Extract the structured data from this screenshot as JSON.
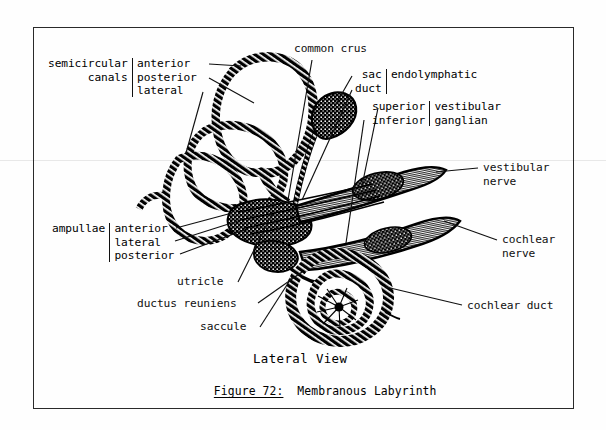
{
  "figure": {
    "view_label": "Lateral View",
    "figure_number": "Figure 72:",
    "figure_title": "Membranous Labyrinth",
    "frame_color": "#2a2a2a",
    "ink_color": "#000000",
    "background_color": "#fefefe"
  },
  "labels": {
    "semicircular_canals": {
      "group_label_line1": "semicircular",
      "group_label_line2": "canals",
      "items": [
        "anterior",
        "posterior",
        "lateral"
      ]
    },
    "common_crus": "common crus",
    "endolymphatic": {
      "items": [
        "sac",
        "duct"
      ],
      "group_label": "endolymphatic"
    },
    "vestibular_ganglian": {
      "items": [
        "superior",
        "inferior"
      ],
      "group_label_line1": "vestibular",
      "group_label_line2": "ganglian"
    },
    "vestibular_nerve_line1": "vestibular",
    "vestibular_nerve_line2": "nerve",
    "cochlear_nerve_line1": "cochlear",
    "cochlear_nerve_line2": "nerve",
    "cochlear_duct": "cochlear duct",
    "ampullae": {
      "group_label": "ampullae",
      "items": [
        "anterior",
        "lateral",
        "posterior"
      ]
    },
    "utricle": "utricle",
    "ductus_reuniens": "ductus reuniens",
    "saccule": "saccule"
  },
  "anatomy": {
    "structures": [
      "anterior semicircular canal",
      "posterior semicircular canal",
      "lateral semicircular canal",
      "common crus",
      "endolymphatic sac",
      "endolymphatic duct",
      "superior vestibular ganglion",
      "inferior vestibular ganglion",
      "vestibular nerve",
      "cochlear nerve",
      "cochlear duct",
      "anterior ampulla",
      "lateral ampulla",
      "posterior ampulla",
      "utricle",
      "ductus reuniens",
      "saccule",
      "cochlea"
    ]
  }
}
